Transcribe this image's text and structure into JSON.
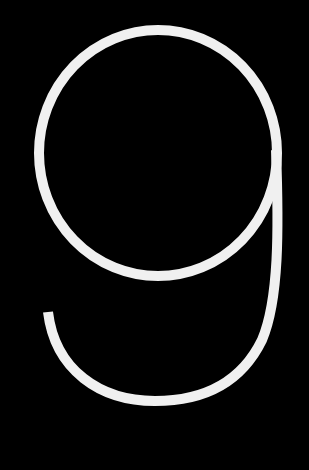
{
  "glyph": {
    "character": "9",
    "stroke_color": "#f0f0f0",
    "background_color": "#000000"
  }
}
